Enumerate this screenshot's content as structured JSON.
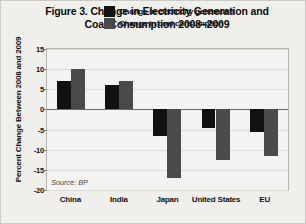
{
  "figure": {
    "title_line1": "Figure 3. Change in Electricity Generation and",
    "title_line2": "Coal Consumption 2008–2009",
    "source": "Source: BP",
    "colors": {
      "series1": "#111111",
      "series2": "#4a4a4a",
      "background": "#f1efec",
      "plot_background": "#f5f3f1",
      "gridline": "#ddd9d5",
      "zero_line": "#6f6c68"
    }
  },
  "chart_data": {
    "type": "bar",
    "title": "Figure 3. Change in Electricity Generation and Coal Consumption 2008–2009",
    "xlabel": "",
    "ylabel": "Percent Change Between 2008 and 2009",
    "ylim": [
      -20,
      15
    ],
    "yticks": [
      15,
      10,
      5,
      0,
      -5,
      -10,
      -15,
      -20
    ],
    "ytick_labels": [
      "15",
      "10",
      "5",
      "0",
      "-5",
      "-10",
      "-15",
      "-20"
    ],
    "grid": true,
    "legend_position": "top-center",
    "categories": [
      "China",
      "India",
      "Japan",
      "United States",
      "EU"
    ],
    "series": [
      {
        "name": "Change in electricity generation",
        "color": "#111111",
        "values": [
          7,
          6,
          -6.5,
          -4.5,
          -5.5
        ]
      },
      {
        "name": "Change in coal consumption",
        "color": "#4a4a4a",
        "values": [
          10,
          7,
          -17,
          -12.5,
          -11.5
        ]
      }
    ],
    "annotations": [
      "Source: BP"
    ]
  }
}
